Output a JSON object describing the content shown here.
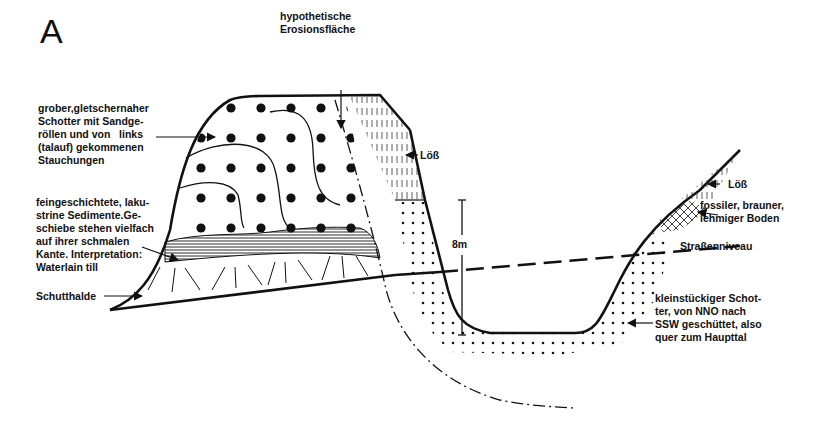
{
  "figure": {
    "panel_label": "A"
  },
  "labels": {
    "coarse_gravel": "grober,gletschernaher\nSchotter mit Sandge-\nröllen und von   links\n(talauf) gekommenen\nStauchungen",
    "erosion_surface": "hypothetische\nErosionsfläche",
    "loess_left": "Löß",
    "lacustrine": "feingeschichtete, laku-\nstrine Sedimente.Ge-\nschiebe stehen vielfach\nauf ihrer schmalen\nKante. Interpretation:\nWaterlain till",
    "talus": "Schutthalde",
    "scale": "8m",
    "loess_right": "Löß",
    "paleosol": "fossiler, brauner,\nlehmiger Boden",
    "road_level": "Straßenniveau",
    "fine_gravel": "kleinstückiger Schot-\nter, von NNO nach\nSSW geschüttet, also\nquer zum Haupttal"
  },
  "legend_patterns": [
    {
      "name": "coarse gravel",
      "pattern": "large dots"
    },
    {
      "name": "fine gravel",
      "pattern": "small dots"
    },
    {
      "name": "lacustrine sediments",
      "pattern": "horizontal hatching"
    },
    {
      "name": "talus",
      "pattern": "radiating strokes"
    },
    {
      "name": "loess",
      "pattern": "vertical dashes"
    },
    {
      "name": "paleosol",
      "pattern": "cross-hatching"
    }
  ],
  "colors": {
    "ink": "#111111",
    "background": "#ffffff"
  }
}
